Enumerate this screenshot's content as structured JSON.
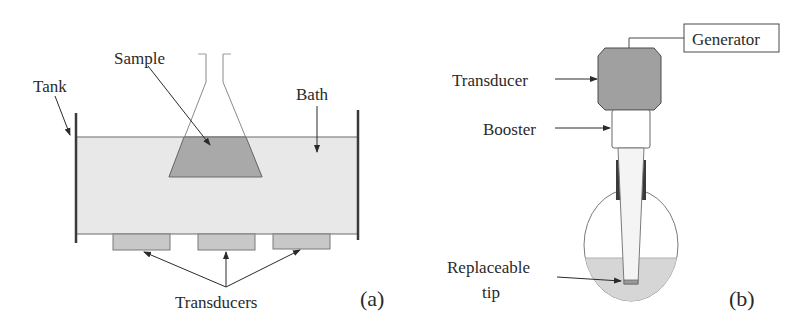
{
  "panel_a": {
    "caption": "(a)",
    "labels": {
      "tank": "Tank",
      "sample": "Sample",
      "bath": "Bath",
      "transducers": "Transducers"
    },
    "colors": {
      "bath_fill": "#e8e8e8",
      "sample_fill": "#a9a9a9",
      "transducer_fill": "#c8c8c8",
      "tank_wall": "#3a3a3a"
    }
  },
  "panel_b": {
    "caption": "(b)",
    "labels": {
      "generator": "Generator",
      "transducer": "Transducer",
      "booster": "Booster",
      "tip_line1": "Replaceable",
      "tip_line2": "tip"
    },
    "colors": {
      "transducer_fill": "#a0a0a0",
      "liquid_fill": "#d6d6d6",
      "clamp": "#3a3a3a"
    }
  }
}
